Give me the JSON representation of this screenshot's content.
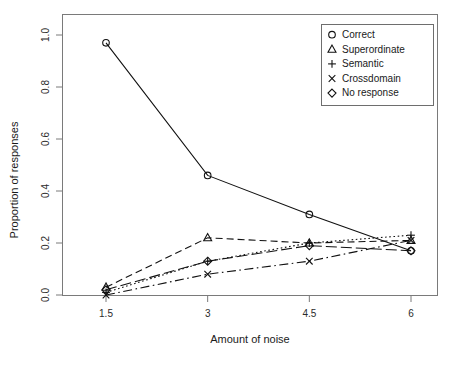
{
  "chart_data": {
    "type": "line",
    "title": "",
    "xlabel": "Amount of noise",
    "ylabel": "Proportion of responses",
    "x": [
      1.5,
      3,
      4.5,
      6
    ],
    "xtick_labels": [
      "1.5",
      "3",
      "4.5",
      "6"
    ],
    "ytick_labels": [
      "0.0",
      "0.2",
      "0.4",
      "0.6",
      "0.8",
      "1.0"
    ],
    "yticks": [
      0.0,
      0.2,
      0.4,
      0.6,
      0.8,
      1.0
    ],
    "xlim": [
      1.0,
      6.5
    ],
    "ylim": [
      -0.04,
      1.02
    ],
    "grid": false,
    "legend_position": "top-right",
    "series": [
      {
        "name": "Correct",
        "marker": "circle",
        "linestyle": "solid",
        "values": [
          0.97,
          0.46,
          0.31,
          0.17
        ]
      },
      {
        "name": "Superordinate",
        "marker": "triangle",
        "linestyle": "dashed",
        "values": [
          0.03,
          0.22,
          0.2,
          0.21
        ]
      },
      {
        "name": "Semantic",
        "marker": "plus",
        "linestyle": "dotted",
        "values": [
          0.01,
          0.13,
          0.2,
          0.23
        ]
      },
      {
        "name": "Crossdomain",
        "marker": "cross",
        "linestyle": "dashdot",
        "values": [
          0.0,
          0.08,
          0.13,
          0.21
        ]
      },
      {
        "name": "No response",
        "marker": "diamond",
        "linestyle": "longdash",
        "values": [
          0.02,
          0.13,
          0.19,
          0.17
        ]
      }
    ]
  },
  "legend": {
    "entries": [
      {
        "label": "Correct",
        "glyph": "circle-marker"
      },
      {
        "label": "Superordinate",
        "glyph": "triangle-marker"
      },
      {
        "label": "Semantic",
        "glyph": "plus-marker"
      },
      {
        "label": "Crossdomain",
        "glyph": "cross-marker"
      },
      {
        "label": "No response",
        "glyph": "diamond-marker"
      }
    ]
  },
  "colors": {
    "ink": "#111111",
    "frame": "#7a7a7a",
    "background": "#ffffff"
  }
}
